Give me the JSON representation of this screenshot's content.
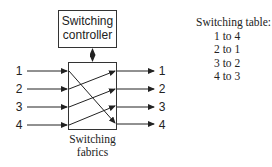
{
  "controller": {
    "label_line1": "Switching",
    "label_line2": "controller"
  },
  "fabric": {
    "label_line1": "Switching",
    "label_line2": "fabrics"
  },
  "inputs": [
    "1",
    "2",
    "3",
    "4"
  ],
  "outputs": [
    "1",
    "2",
    "3",
    "4"
  ],
  "table": {
    "title": "Switching table:",
    "rows": [
      "1 to 4",
      "2 to 1",
      "3 to 2",
      "4 to 3"
    ]
  }
}
